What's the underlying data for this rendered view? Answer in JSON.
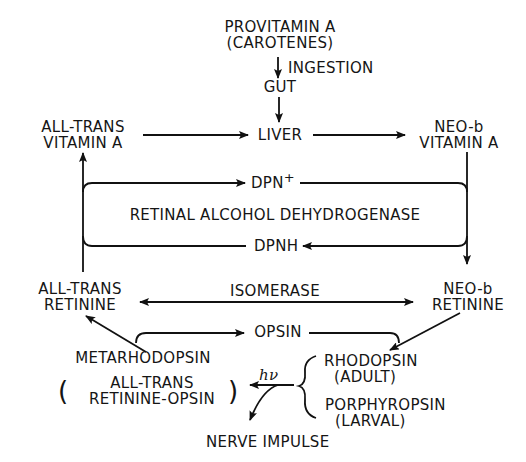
{
  "diagram": {
    "type": "biochemical-pathway",
    "nodes": {
      "provitamin": {
        "line1": "PROVITAMIN A",
        "line2": "(CAROTENES)"
      },
      "ingestion": "INGESTION",
      "gut": "GUT",
      "liver": "LIVER",
      "all_trans_vitamin_a": {
        "line1": "ALL-TRANS",
        "line2": "VITAMIN A"
      },
      "neo_b_vitamin_a": {
        "line1": "NEO-b",
        "line2": "VITAMIN A"
      },
      "dpn_plus": "DPN",
      "dpn_plus_sup": "+",
      "enzyme": "RETINAL ALCOHOL DEHYDROGENASE",
      "dpnh": "DPNH",
      "all_trans_retinine": {
        "line1": "ALL-TRANS",
        "line2": "RETININE"
      },
      "neo_b_retinine": {
        "line1": "NEO-b",
        "line2": "RETININE"
      },
      "isomerase": "ISOMERASE",
      "opsin": "OPSIN",
      "metarhodopsin": {
        "title": "METARHODOPSIN",
        "line1": "ALL-TRANS",
        "line2": "RETININE-OPSIN"
      },
      "light": "hν",
      "rhodopsin": {
        "line1": "RHODOPSIN",
        "line2": "(ADULT)"
      },
      "porphyropsin": {
        "line1": "PORPHYROPSIN",
        "line2": "(LARVAL)"
      },
      "nerve_impulse": "NERVE IMPULSE"
    },
    "edges": [
      {
        "from": "PROVITAMIN A",
        "to": "GUT",
        "label": "INGESTION"
      },
      {
        "from": "GUT",
        "to": "LIVER"
      },
      {
        "from": "ALL-TRANS VITAMIN A",
        "to": "LIVER"
      },
      {
        "from": "LIVER",
        "to": "NEO-b VITAMIN A"
      },
      {
        "from": "NEO-b VITAMIN A",
        "to": "NEO-b RETININE",
        "cofactor": "DPN+ → DPNH"
      },
      {
        "from": "ALL-TRANS RETININE",
        "to": "ALL-TRANS VITAMIN A",
        "cofactor": "DPNH → DPN+"
      },
      {
        "from": "ALL-TRANS RETININE",
        "to": "NEO-b RETININE",
        "label": "ISOMERASE",
        "bidirectional": true
      },
      {
        "from": "NEO-b RETININE",
        "to": "RHODOPSIN / PORPHYROPSIN"
      },
      {
        "from": "METARHODOPSIN",
        "to": "OPSIN"
      },
      {
        "from": "OPSIN",
        "to": "RHODOPSIN / PORPHYROPSIN"
      },
      {
        "from": "METARHODOPSIN",
        "to": "ALL-TRANS RETININE"
      },
      {
        "from": "RHODOPSIN / PORPHYROPSIN",
        "to": "METARHODOPSIN",
        "label": "hν"
      },
      {
        "from": "hν reaction",
        "to": "NERVE IMPULSE"
      }
    ]
  }
}
